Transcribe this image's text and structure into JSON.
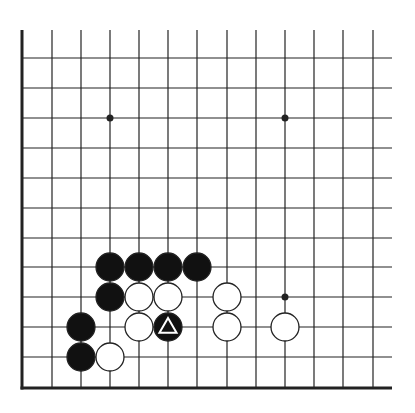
{
  "board": {
    "type": "go-diagram",
    "corner": "bottom-left",
    "colors": {
      "background": "#ffffff",
      "line": "#222222",
      "black_stone": "#111111",
      "white_stone": "#ffffff",
      "stone_outline": "#222222",
      "marker": "#ffffff"
    },
    "columns_x": [
      22,
      52,
      81,
      110,
      139,
      168,
      197,
      227,
      256,
      285,
      314,
      343,
      373
    ],
    "rows_y": [
      58,
      88,
      118,
      148,
      178,
      208,
      238,
      267,
      297,
      327,
      357,
      388
    ],
    "top_y": 30,
    "right_x": 392,
    "stone_radius": 14,
    "star_points": [
      {
        "col": 3,
        "row": 2
      },
      {
        "col": 9,
        "row": 2
      },
      {
        "col": 9,
        "row": 8
      }
    ],
    "stones": [
      {
        "color": "black",
        "col": 3,
        "row": 7
      },
      {
        "color": "black",
        "col": 4,
        "row": 7
      },
      {
        "color": "black",
        "col": 5,
        "row": 7
      },
      {
        "color": "black",
        "col": 6,
        "row": 7
      },
      {
        "color": "black",
        "col": 3,
        "row": 8
      },
      {
        "color": "white",
        "col": 4,
        "row": 8
      },
      {
        "color": "white",
        "col": 5,
        "row": 8
      },
      {
        "color": "white",
        "col": 7,
        "row": 8
      },
      {
        "color": "black",
        "col": 2,
        "row": 9
      },
      {
        "color": "white",
        "col": 4,
        "row": 9
      },
      {
        "color": "black",
        "col": 5,
        "row": 9,
        "marker": "triangle"
      },
      {
        "color": "white",
        "col": 7,
        "row": 9
      },
      {
        "color": "white",
        "col": 9,
        "row": 9
      },
      {
        "color": "black",
        "col": 2,
        "row": 10
      },
      {
        "color": "white",
        "col": 3,
        "row": 10
      }
    ]
  }
}
